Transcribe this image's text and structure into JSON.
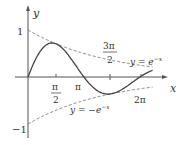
{
  "chart_data": {
    "type": "line",
    "title": "",
    "xlabel": "x",
    "ylabel": "y",
    "series": [
      {
        "name": "y = e^{-x} sin x",
        "style": "solid",
        "x": [
          0,
          0.785,
          1.571,
          2.356,
          3.1416,
          3.927,
          4.712,
          5.498,
          6.283,
          7.0
        ],
        "y": [
          0,
          0.322,
          0.208,
          0.067,
          0,
          -0.014,
          -0.009,
          -0.003,
          0,
          0.001
        ]
      },
      {
        "name": "y = e^{-x}",
        "style": "dashed"
      },
      {
        "name": "y = -e^{-x}",
        "style": "dashed"
      }
    ],
    "x_ticks": [
      "π/2",
      "π",
      "3π/2",
      "2π"
    ],
    "y_ticks": [
      "1",
      "-1"
    ],
    "annotations": [
      "y = e^{-x}",
      "y = -e^{-x}"
    ]
  },
  "labels": {
    "y": "y",
    "x": "x",
    "one": "1",
    "minus_one": "−1",
    "pi2_num": "π",
    "pi2_den": "2",
    "pi": "π",
    "three_pi2_num": "3π",
    "three_pi2_den": "2",
    "two_pi": "2π",
    "upper": "y = e",
    "upper_exp": "−x",
    "lower": "y = −e",
    "lower_exp": "−x"
  }
}
